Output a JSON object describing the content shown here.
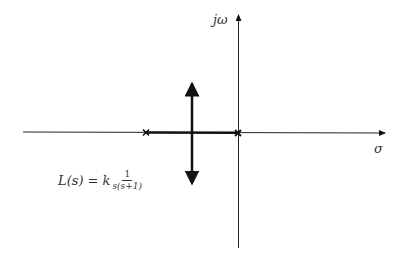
{
  "diagram": {
    "type": "root-locus",
    "axes": {
      "real_axis_label": "σ",
      "imag_axis_label": "jω"
    },
    "transfer_function": {
      "lhs": "L(s) = k",
      "numerator": "1",
      "denominator": "s(s+1)"
    },
    "poles": [
      {
        "name": "pole-at-minus-one",
        "marker": "×"
      },
      {
        "name": "pole-at-origin",
        "marker": "×"
      }
    ],
    "branches": [
      {
        "name": "real-axis-segment",
        "description": "between poles"
      },
      {
        "name": "vertical-asymptote-up",
        "direction": "up"
      },
      {
        "name": "vertical-asymptote-down",
        "direction": "down"
      }
    ],
    "colors": {
      "line": "#111111",
      "background": "#ffffff"
    }
  }
}
